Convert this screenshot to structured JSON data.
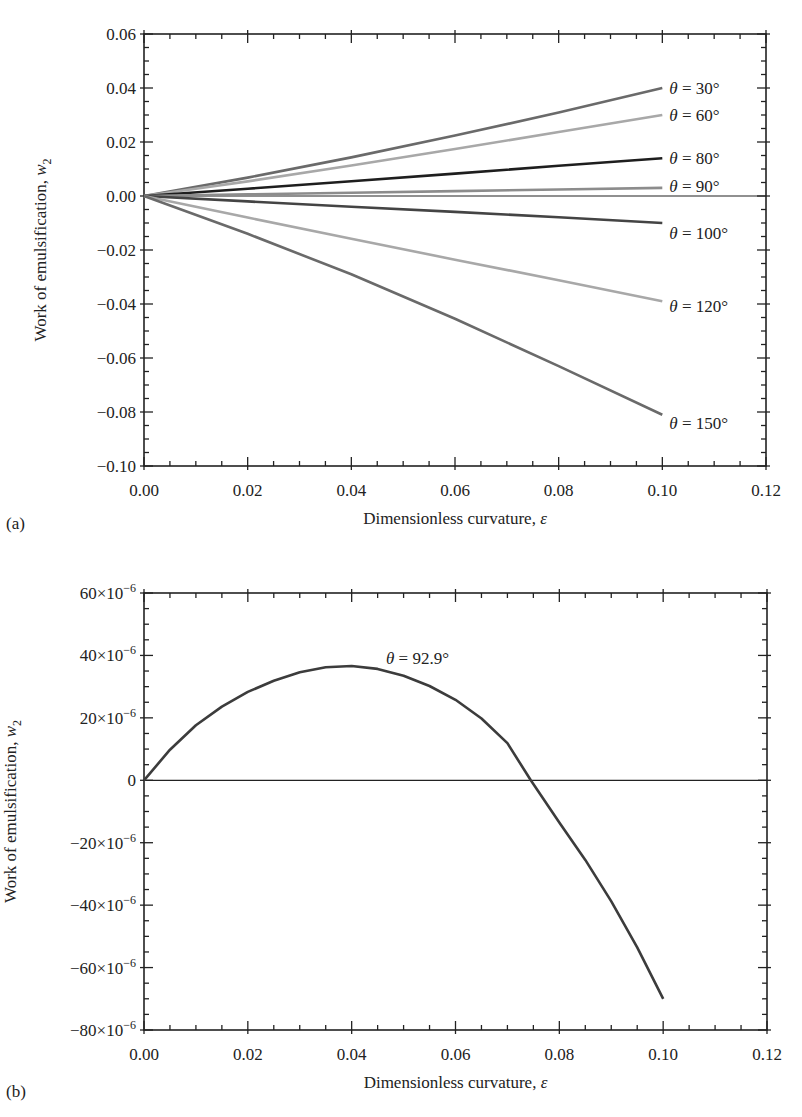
{
  "figure": {
    "panels": [
      "(a)",
      "(b)"
    ]
  },
  "chart_data": [
    {
      "panel": "(a)",
      "type": "line",
      "title": "",
      "xlabel": "Dimensionless curvature, ε",
      "ylabel": "Work of emulsification, w",
      "ylabel_subscript": "2",
      "xlim": [
        0,
        0.12
      ],
      "ylim": [
        -0.1,
        0.06
      ],
      "xticks": [
        "0.00",
        "0.02",
        "0.04",
        "0.06",
        "0.08",
        "0.10",
        "0.12"
      ],
      "yticks": [
        "0.06",
        "0.04",
        "0.02",
        "0.00",
        "-0.02",
        "-0.04",
        "-0.06",
        "-0.08",
        "-0.10"
      ],
      "xtick_values": [
        0,
        0.02,
        0.04,
        0.06,
        0.08,
        0.1,
        0.12
      ],
      "ytick_values": [
        0.06,
        0.04,
        0.02,
        0.0,
        -0.02,
        -0.04,
        -0.06,
        -0.08,
        -0.1
      ],
      "zero_line": true,
      "grid": false,
      "legend": "inline labels at line ends",
      "x": [
        0,
        0.02,
        0.04,
        0.06,
        0.08,
        0.1
      ],
      "series": [
        {
          "name": "θ = 30°",
          "color": "#6a6a6a",
          "values": [
            0,
            0.0068,
            0.0143,
            0.0224,
            0.0309,
            0.04
          ]
        },
        {
          "name": "θ = 60°",
          "color": "#a8a8a8",
          "values": [
            0,
            0.0054,
            0.0113,
            0.0174,
            0.0237,
            0.03
          ]
        },
        {
          "name": "θ = 80°",
          "color": "#1e1e1e",
          "values": [
            0,
            0.0027,
            0.0055,
            0.0083,
            0.0112,
            0.014
          ]
        },
        {
          "name": "θ = 90°",
          "color": "#8c8c8c",
          "values": [
            0,
            0.0006,
            0.0012,
            0.0018,
            0.0024,
            0.003
          ]
        },
        {
          "name": "θ = 100°",
          "color": "#444444",
          "values": [
            0,
            -0.002,
            -0.004,
            -0.0059,
            -0.0079,
            -0.01
          ]
        },
        {
          "name": "θ = 120°",
          "color": "#a8a8a8",
          "values": [
            0,
            -0.008,
            -0.0158,
            -0.0236,
            -0.0312,
            -0.039
          ]
        },
        {
          "name": "θ = 150°",
          "color": "#6a6a6a",
          "values": [
            0,
            -0.014,
            -0.029,
            -0.0455,
            -0.063,
            -0.081
          ]
        }
      ]
    },
    {
      "panel": "(b)",
      "type": "line",
      "title": "",
      "xlabel": "Dimensionless curvature, ε",
      "ylabel": "Work of emulsification, w",
      "ylabel_subscript": "2",
      "xlim": [
        0,
        0.12
      ],
      "ylim": [
        -8e-05,
        6e-05
      ],
      "xticks": [
        "0.00",
        "0.02",
        "0.04",
        "0.06",
        "0.08",
        "0.10",
        "0.12"
      ],
      "yticks": [
        "60×10⁻⁶",
        "40×10⁻⁶",
        "20×10⁻⁶",
        "0",
        "−20×10⁻⁶",
        "−40×10⁻⁶",
        "−60×10⁻⁶",
        "−80×10⁻⁶"
      ],
      "xtick_values": [
        0,
        0.02,
        0.04,
        0.06,
        0.08,
        0.1,
        0.12
      ],
      "ytick_values": [
        6e-05,
        4e-05,
        2e-05,
        0,
        -2e-05,
        -4e-05,
        -6e-05,
        -8e-05
      ],
      "zero_line": true,
      "grid": false,
      "annotation": "θ = 92.9°",
      "x": [
        0,
        0.005,
        0.01,
        0.015,
        0.02,
        0.025,
        0.03,
        0.035,
        0.04,
        0.045,
        0.05,
        0.055,
        0.06,
        0.065,
        0.07,
        0.0745,
        0.08,
        0.085,
        0.09,
        0.095,
        0.1
      ],
      "series": [
        {
          "name": "θ = 92.9°",
          "color": "#3c3c3c",
          "values": [
            0,
            9.8e-06,
            1.76e-05,
            2.36e-05,
            2.83e-05,
            3.19e-05,
            3.46e-05,
            3.62e-05,
            3.66e-05,
            3.57e-05,
            3.35e-05,
            3.02e-05,
            2.58e-05,
            1.98e-05,
            1.19e-05,
            0,
            -1.35e-05,
            -2.55e-05,
            -3.88e-05,
            -5.35e-05,
            -7e-05
          ]
        }
      ]
    }
  ]
}
